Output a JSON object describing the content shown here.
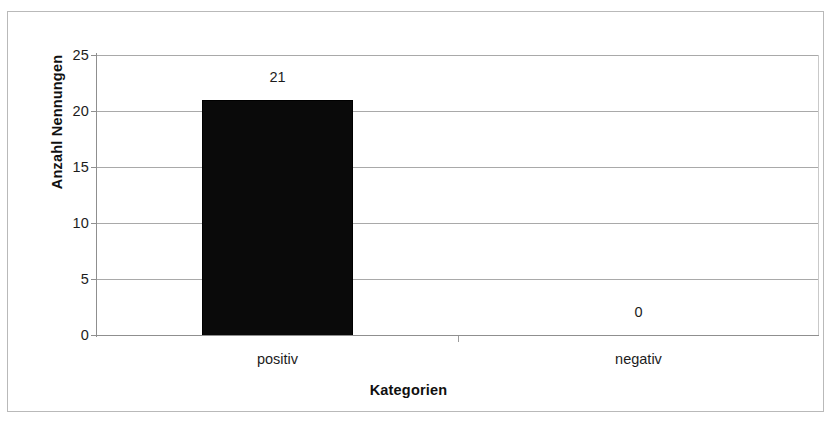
{
  "chart_data": {
    "type": "bar",
    "title": "",
    "subtitle": "",
    "xlabel": "Kategorien",
    "ylabel": "Anzahl Nennungen",
    "categories": [
      "positiv",
      "negativ"
    ],
    "values": [
      21,
      0
    ],
    "data_labels": [
      "21",
      "0"
    ],
    "ylim": [
      0,
      25
    ],
    "ytick_labels": [
      "25",
      "20",
      "15",
      "10",
      "5",
      "0"
    ],
    "ytick_values": [
      25,
      20,
      15,
      10,
      5,
      0
    ],
    "ytick_step": 5,
    "grid": "horizontal",
    "legend": "none",
    "series": [
      {
        "name": "Anzahl Nennungen",
        "values": [
          21,
          0
        ],
        "color": "#0a0a0a"
      }
    ],
    "colors": {
      "bar": "#0a0a0a",
      "gridline": "#a9a9a9",
      "axis": "#8f8f8f",
      "frame": "#b9b9b9",
      "text": "#1c1c1c",
      "plot_background": "#ffffff"
    }
  }
}
